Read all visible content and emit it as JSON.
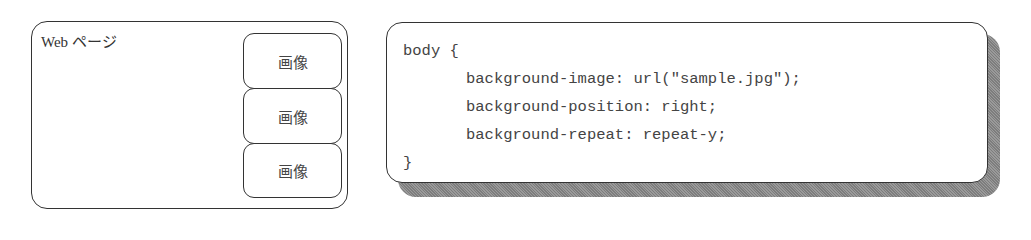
{
  "webpage_diagram": {
    "label": "Web ページ",
    "images": [
      {
        "label": "画像"
      },
      {
        "label": "画像"
      },
      {
        "label": "画像"
      }
    ]
  },
  "css_code": {
    "lines": [
      "body {",
      "background-image: url(\"sample.jpg\");",
      "background-position: right;",
      "background-repeat: repeat-y;",
      "}"
    ]
  },
  "colors": {
    "border": "#333333",
    "text": "#444444",
    "shadow": "#8a8a8a"
  }
}
